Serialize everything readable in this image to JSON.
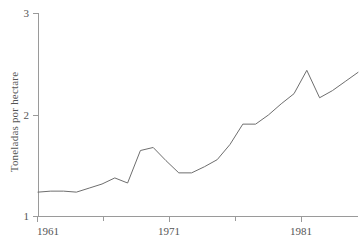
{
  "chart_data": {
    "type": "line",
    "title": "",
    "subtitle": "",
    "xlabel": "",
    "ylabel": "Toneladas por hectare",
    "xlim": [
      1961,
      1986
    ],
    "ylim": [
      1,
      3
    ],
    "grid": false,
    "legend": null,
    "x_ticks": [
      "1961",
      "1971",
      "1981"
    ],
    "x_tick_values": [
      1961,
      1971,
      1981
    ],
    "x_minor_tick_values": [
      1966,
      1976
    ],
    "y_ticks": [
      "1",
      "2",
      "3"
    ],
    "y_tick_values": [
      1,
      2,
      3
    ],
    "line_color": "#6e6e6e",
    "axis_color": "#9a9a9a",
    "x": [
      1961,
      1962,
      1963,
      1964,
      1965,
      1966,
      1967,
      1968,
      1969,
      1970,
      1971,
      1972,
      1973,
      1974,
      1975,
      1976,
      1977,
      1978,
      1979,
      1980,
      1981,
      1982,
      1983,
      1984,
      1985,
      1986
    ],
    "series": [
      {
        "name": "Toneladas por hectare",
        "values": [
          1.24,
          1.25,
          1.25,
          1.24,
          1.28,
          1.32,
          1.38,
          1.33,
          1.65,
          1.68,
          1.55,
          1.43,
          1.43,
          1.49,
          1.56,
          1.71,
          1.91,
          1.91,
          2.0,
          2.11,
          2.21,
          2.44,
          2.17,
          2.24,
          2.33,
          2.42
        ]
      }
    ]
  },
  "axes": {
    "y_axis_label": "Toneladas por hectare",
    "y_tick_top": "3",
    "y_tick_mid": "2",
    "y_tick_bottom": "1",
    "x_tick_first": "1961",
    "x_tick_second": "1971",
    "x_tick_third": "1981"
  }
}
